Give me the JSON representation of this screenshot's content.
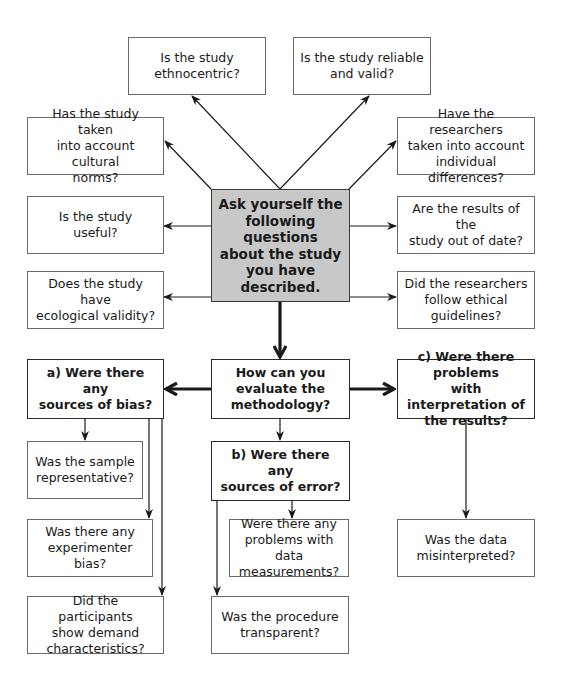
{
  "diagram": {
    "center": {
      "label": "Ask yourself the\nfollowing questions\nabout the study\nyou have described."
    },
    "questions_top": [
      {
        "id": "ethnocentric",
        "label": "Is the study\nethnocentric?"
      },
      {
        "id": "reliable",
        "label": "Is the study reliable\nand valid?"
      },
      {
        "id": "cultural-norms",
        "label": "Has the study taken\ninto account cultural\nnorms?"
      },
      {
        "id": "individual-differences",
        "label": "Have the researchers\ntaken into account\nindividual differences?"
      },
      {
        "id": "useful",
        "label": "Is the study\nuseful?"
      },
      {
        "id": "out-of-date",
        "label": "Are the results of the\nstudy out of date?"
      },
      {
        "id": "ecological-validity",
        "label": "Does the study have\necological validity?"
      },
      {
        "id": "ethical-guidelines",
        "label": "Did the researchers\nfollow ethical\nguidelines?"
      }
    ],
    "methodology": {
      "label": "How can you\nevaluate the\nmethodology?"
    },
    "branches": {
      "a": {
        "prefix": "a)",
        "label": " Were there any\nsources of bias?",
        "children": [
          "Was the sample\nrepresentative?",
          "Was there any\nexperimenter bias?",
          "Did the participants\nshow demand\ncharacteristics?"
        ]
      },
      "b": {
        "prefix": "b)",
        "label": " Were there any\nsources of error?",
        "children": [
          "Were there any\nproblems with data\nmeasurements?",
          "Was the procedure\ntransparent?"
        ]
      },
      "c": {
        "prefix": "c)",
        "label": " Were there problems\nwith interpretation of\nthe results?",
        "children": [
          "Was the data\nmisinterpreted?"
        ]
      }
    },
    "colors": {
      "center_fill": "#c8c8c8",
      "box_border": "#6b6b6b",
      "arrow": "#1a1a1a"
    }
  }
}
